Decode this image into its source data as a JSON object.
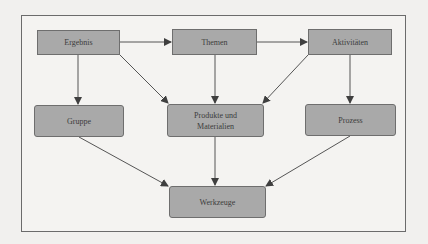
{
  "diagram": {
    "nodes": [
      {
        "id": "ergebnis",
        "label": "Ergebnis"
      },
      {
        "id": "themen",
        "label": "Themen"
      },
      {
        "id": "aktivitaeten",
        "label": "Aktivitäten"
      },
      {
        "id": "gruppe",
        "label": "Gruppe"
      },
      {
        "id": "produkte",
        "label": "Produkte und Materialien",
        "line1": "Produkte und",
        "line2": "Materialien"
      },
      {
        "id": "prozess",
        "label": "Prozess"
      },
      {
        "id": "werkzeuge",
        "label": "Werkzeuge"
      }
    ],
    "edges": [
      {
        "from": "ergebnis",
        "to": "themen"
      },
      {
        "from": "themen",
        "to": "aktivitaeten"
      },
      {
        "from": "ergebnis",
        "to": "gruppe"
      },
      {
        "from": "ergebnis",
        "to": "produkte"
      },
      {
        "from": "themen",
        "to": "produkte"
      },
      {
        "from": "aktivitaeten",
        "to": "produkte"
      },
      {
        "from": "aktivitaeten",
        "to": "prozess"
      },
      {
        "from": "gruppe",
        "to": "werkzeuge"
      },
      {
        "from": "produkte",
        "to": "werkzeuge"
      },
      {
        "from": "prozess",
        "to": "werkzeuge"
      }
    ],
    "colors": {
      "node_fill": "#a9a9a9",
      "node_border": "#6e6e6e",
      "edge": "#4a4a4a",
      "background": "#f1f0ee"
    }
  }
}
